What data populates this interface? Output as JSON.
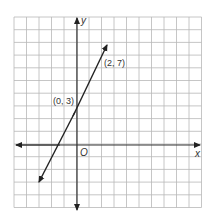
{
  "graph": {
    "x_axis_label": "x",
    "y_axis_label": "y",
    "origin_label": "O",
    "points": [
      {
        "label": "(0, 3)",
        "x": 0,
        "y": 3
      },
      {
        "label": "(2, 7)",
        "x": 2,
        "y": 7
      }
    ],
    "grid": {
      "x_min": -5,
      "x_max": 10,
      "y_min": -5,
      "y_max": 10
    },
    "line": {
      "slope": 2,
      "intercept": 3
    },
    "colors": {
      "grid": "#b8b8b8",
      "axis": "#333333",
      "line": "#222222"
    }
  }
}
